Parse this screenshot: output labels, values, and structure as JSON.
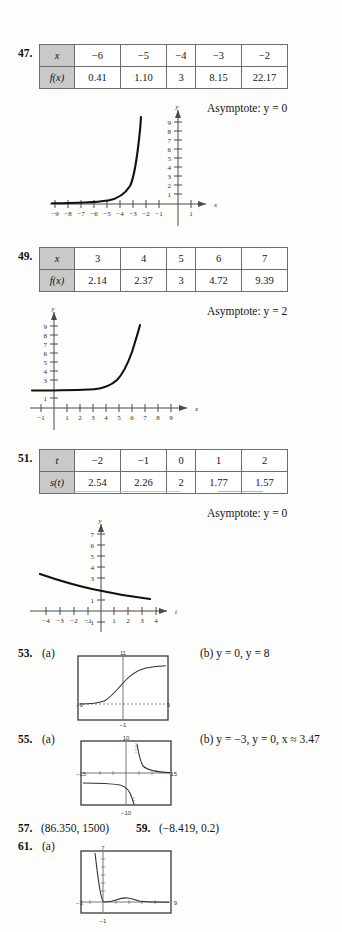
{
  "page": {
    "background": "#fdfdfc",
    "text_color": "#141414",
    "table_header_bg": "#c9c9c9",
    "tint_green": "#9fd39f",
    "tint_purple": "#b49ac4"
  },
  "problems": [
    {
      "number": "47.",
      "table": {
        "row_labels": [
          "x",
          "f(x)"
        ],
        "columns": [
          {
            "x": "−6",
            "fx": "0.41"
          },
          {
            "x": "−5",
            "fx": "1.10"
          },
          {
            "x": "−4",
            "fx": "3"
          },
          {
            "x": "−3",
            "fx": "8.15"
          },
          {
            "x": "−2",
            "fx": "22.17"
          }
        ]
      },
      "asymptote": "Asymptote: y = 0",
      "graph": {
        "x_label": "x",
        "y_label": "y",
        "x_ticks": [
          "−9",
          "−8",
          "−7",
          "−6",
          "−5",
          "−4",
          "−3",
          "−2",
          "−1",
          "1"
        ],
        "y_ticks": [
          "1",
          "2",
          "3",
          "4",
          "5",
          "6",
          "7",
          "8",
          "9"
        ],
        "xlim": [
          -9.8,
          1.8
        ],
        "ylim": [
          -1.2,
          10
        ],
        "curve_description": "increasing exponential rising steeply near x = -3"
      }
    },
    {
      "number": "49.",
      "table": {
        "row_labels": [
          "x",
          "f(x)"
        ],
        "columns": [
          {
            "x": "3",
            "fx": "2.14"
          },
          {
            "x": "4",
            "fx": "2.37"
          },
          {
            "x": "5",
            "fx": "3"
          },
          {
            "x": "6",
            "fx": "4.72"
          },
          {
            "x": "7",
            "fx": "9.39"
          }
        ]
      },
      "asymptote": "Asymptote: y = 2",
      "graph": {
        "x_label": "x",
        "y_label": "y",
        "x_ticks": [
          "−1",
          "1",
          "2",
          "3",
          "4",
          "5",
          "6",
          "7",
          "8",
          "9"
        ],
        "y_ticks": [
          "1",
          "3",
          "4",
          "5",
          "6",
          "7",
          "8",
          "9"
        ],
        "xlim": [
          -1.8,
          9.8
        ],
        "ylim": [
          -1.2,
          10
        ],
        "curve_description": "exponential approaching y = 2 on the left, rising steeply near x = 7"
      }
    },
    {
      "number": "51.",
      "table": {
        "row_labels": [
          "t",
          "s(t)"
        ],
        "columns": [
          {
            "x": "−2",
            "fx": "2.54"
          },
          {
            "x": "−1",
            "fx": "2.26"
          },
          {
            "x": "0",
            "fx": "2"
          },
          {
            "x": "1",
            "fx": "1.77"
          },
          {
            "x": "2",
            "fx": "1.57"
          }
        ]
      },
      "asymptote": "Asymptote: y = 0",
      "graph": {
        "x_label": "t",
        "y_label": "y",
        "x_ticks": [
          "−4",
          "−3",
          "−2",
          "−1",
          "1",
          "2",
          "3",
          "4"
        ],
        "y_ticks": [
          "−1",
          "1",
          "3",
          "4",
          "5",
          "6",
          "7"
        ],
        "xlim": [
          -4.8,
          4.8
        ],
        "ylim": [
          -1.6,
          7.6
        ],
        "curve_description": "slowly decreasing exponential decay from about 3.4 to 1.1"
      }
    },
    {
      "number": "53.",
      "part_a": "(a)",
      "part_b": "(b)  y = 0, y = 8",
      "screen": {
        "xmin": "−9",
        "xmax": "9",
        "ymin": "−1",
        "ymax": "11",
        "curve_description": "logistic S-curve rising from 0 to about 8"
      }
    },
    {
      "number": "55.",
      "part_a": "(a)",
      "part_b": "(b)  y = −3, y = 0, x ≈ 3.47",
      "screen": {
        "xmin": "−15",
        "xmax": "15",
        "ymin": "−10",
        "ymax": "10",
        "curve_description": "two hyperbolic branches with vertical asymptote near x = 3.47"
      }
    },
    {
      "number": "57.",
      "answer": "(86.350, 1500)"
    },
    {
      "number": "59.",
      "answer": "(−8.419, 0.2)"
    },
    {
      "number": "61.",
      "part_a": "(a)",
      "screen": {
        "xmin": "−3",
        "xmax": "9",
        "ymin": "−1",
        "ymax": "7",
        "curve_description": "steeply falling branch near x = 0 with small bump between x = 1 and 4"
      }
    }
  ]
}
